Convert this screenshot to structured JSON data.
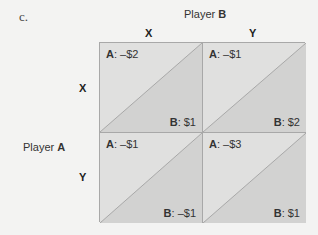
{
  "part_label": "c.",
  "player_b": {
    "prefix": "Player ",
    "name": "B"
  },
  "player_a": {
    "prefix": "Player ",
    "name": "A"
  },
  "columns": [
    "X",
    "Y"
  ],
  "rows": [
    "X",
    "Y"
  ],
  "cells": [
    {
      "a_key": "A",
      "a_val": ": –$2",
      "b_key": "B",
      "b_val": ": $1"
    },
    {
      "a_key": "A",
      "a_val": ": –$1",
      "b_key": "B",
      "b_val": ": $2"
    },
    {
      "a_key": "A",
      "a_val": ": –$1",
      "b_key": "B",
      "b_val": ": –$1"
    },
    {
      "a_key": "A",
      "a_val": ": –$3",
      "b_key": "B",
      "b_val": ": $1"
    }
  ],
  "colors": {
    "background": "#f3f3f2",
    "upper_triangle": "#e0e0df",
    "lower_triangle": "#d2d2d1",
    "line": "#9a9a9a"
  }
}
